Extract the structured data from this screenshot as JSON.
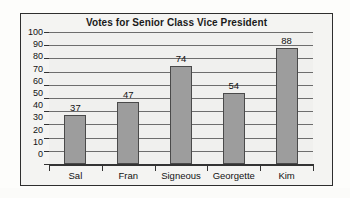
{
  "chart_data": {
    "type": "bar",
    "title": "Votes for Senior Class Vice President",
    "xlabel": "",
    "ylabel": "",
    "categories": [
      "Sal",
      "Fran",
      "Signeous",
      "Georgette",
      "Kim"
    ],
    "values": [
      37,
      47,
      74,
      54,
      88
    ],
    "value_labels": [
      "37",
      "47",
      "74",
      "54",
      "88"
    ],
    "ylim": [
      0,
      100
    ],
    "ytick_step": 10,
    "yticks": [
      100,
      90,
      80,
      70,
      60,
      50,
      40,
      30,
      20,
      10,
      0
    ],
    "ytick_labels": [
      "100",
      "90",
      "80",
      "70",
      "60",
      "50",
      "40",
      "30",
      "20",
      "10",
      "0"
    ],
    "grid": "horizontal",
    "legend": "none",
    "series": [
      {
        "name": "Votes",
        "values": [
          37,
          47,
          74,
          54,
          88
        ]
      }
    ],
    "colors": {
      "bar_fill": "#9d9d9d",
      "bar_border": "#4a4a4a",
      "gridline": "#6d6d6d",
      "axis": "#333333",
      "plot_background": "#f0f0ee",
      "frame_background": "#f4f4f2",
      "frame_border": "#2e2e2e",
      "text": "#121212",
      "page_background": "#fdfdfb"
    }
  }
}
